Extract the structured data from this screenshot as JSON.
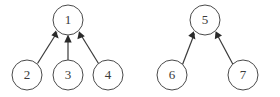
{
  "diagram": {
    "type": "directed-graph",
    "background_color": "#ffffff",
    "node_fill_color": "#ffffff",
    "node_stroke_color": "#4a4a4a",
    "edge_color": "#3a3a3a",
    "label_color": "#3a3a3a",
    "node_radius": 15,
    "clusters": [
      {
        "name": "left-cluster",
        "root": "1",
        "nodes": [
          {
            "id": "n1",
            "label": "1",
            "cx": 68,
            "cy": 20
          },
          {
            "id": "n2",
            "label": "2",
            "cx": 27,
            "cy": 75
          },
          {
            "id": "n3",
            "label": "3",
            "cx": 68,
            "cy": 75
          },
          {
            "id": "n4",
            "label": "4",
            "cx": 108,
            "cy": 75
          }
        ],
        "edges": [
          {
            "from": "2",
            "to": "1",
            "direction": "upward"
          },
          {
            "from": "3",
            "to": "1",
            "direction": "upward"
          },
          {
            "from": "4",
            "to": "1",
            "direction": "upward"
          }
        ]
      },
      {
        "name": "right-cluster",
        "root": "5",
        "nodes": [
          {
            "id": "n5",
            "label": "5",
            "cx": 205,
            "cy": 20
          },
          {
            "id": "n6",
            "label": "6",
            "cx": 172,
            "cy": 75
          },
          {
            "id": "n7",
            "label": "7",
            "cx": 243,
            "cy": 75
          }
        ],
        "edges": [
          {
            "from": "6",
            "to": "5",
            "direction": "upward"
          },
          {
            "from": "7",
            "to": "5",
            "direction": "upward"
          }
        ]
      }
    ]
  }
}
